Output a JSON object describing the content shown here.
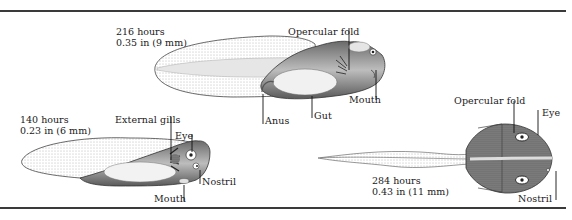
{
  "figure": {
    "stages": [
      {
        "id": "stage-140",
        "time": "140 hours",
        "size": "0.23 in (6 mm)",
        "labels": {
          "external_gills": "External gills",
          "eye": "Eye",
          "nostril": "Nostril",
          "mouth": "Mouth"
        }
      },
      {
        "id": "stage-216",
        "time": "216 hours",
        "size": "0.35 in (9 mm)",
        "labels": {
          "opercular_fold": "Opercular fold",
          "mouth": "Mouth",
          "gut": "Gut",
          "anus": "Anus"
        }
      },
      {
        "id": "stage-284",
        "time": "284 hours",
        "size": "0.43 in (11 mm)",
        "labels": {
          "opercular_fold": "Opercular fold",
          "eye": "Eye",
          "nostril": "Nostril"
        }
      }
    ]
  },
  "colors": {
    "ink": "#1a1a1a",
    "rule": "#3a3a3a",
    "shade_dark": "#555555",
    "shade_mid": "#9a9a9a",
    "shade_light": "#d9d9d9",
    "background": "#ffffff"
  }
}
